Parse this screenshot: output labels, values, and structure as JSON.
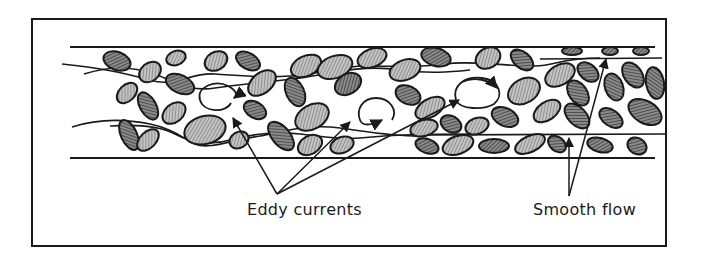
{
  "diagram": {
    "labels": {
      "eddy": "Eddy currents",
      "smooth": "Smooth flow"
    },
    "colors": {
      "ink": "#1a1a1a",
      "cell_light": "#9a9a9a",
      "cell_dark": "#5a5a5a",
      "background": "#ffffff"
    },
    "vessel": {
      "top_wall_y": 47,
      "bottom_wall_y": 158,
      "x_start": 70,
      "x_end": 655
    },
    "eddies": [
      {
        "cx": 220,
        "cy": 97,
        "rx": 22,
        "ry": 16
      },
      {
        "cx": 378,
        "cy": 113,
        "rx": 20,
        "ry": 16
      },
      {
        "cx": 479,
        "cy": 90,
        "rx": 22,
        "ry": 16
      }
    ]
  }
}
